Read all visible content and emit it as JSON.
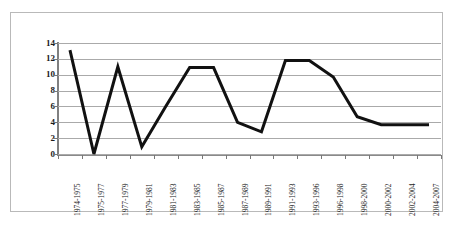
{
  "chart_data": {
    "type": "line",
    "title": "",
    "subtitle": "",
    "xlabel": "",
    "ylabel": "",
    "grid": true,
    "legend": false,
    "legend_position": "none",
    "ylim": [
      0,
      14
    ],
    "ytick_labels": [
      "0",
      "2",
      "4",
      "6",
      "8",
      "10",
      "12",
      "14"
    ],
    "ytick_values": [
      0,
      2,
      4,
      6,
      8,
      10,
      12,
      14
    ],
    "categories": [
      "1974-1975",
      "1975-1977",
      "1977-1979",
      "1979-1981",
      "1981-1983",
      "1983-1985",
      "1985-1987",
      "1987-1989",
      "1989-1991",
      "1991-1993",
      "1993-1996",
      "1996-1998",
      "1998-2000",
      "2000-2002",
      "2002-2004",
      "2004-2007"
    ],
    "values": [
      13.1,
      0,
      11,
      0.9,
      6,
      10.9,
      10.9,
      4,
      2.8,
      11.8,
      11.8,
      9.7,
      4.7,
      3.7,
      3.7,
      3.7
    ],
    "series": [
      {
        "name": "series-1",
        "color": "#111111",
        "line_width": 3,
        "values": [
          13.1,
          0,
          11,
          0.9,
          6,
          10.9,
          10.9,
          4,
          2.8,
          11.8,
          11.8,
          9.7,
          4.7,
          3.7,
          3.7,
          3.7
        ]
      }
    ],
    "colors": {
      "line": "#111111",
      "gridline": "#aaaaaa",
      "axis": "#808080",
      "frame": "#b9b9b9",
      "background": "#ffffff",
      "tick_text": "#262626"
    }
  }
}
